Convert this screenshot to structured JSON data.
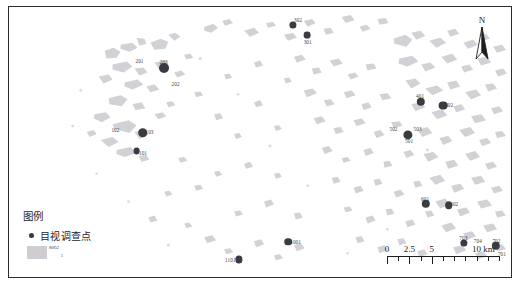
{
  "map": {
    "title": "visual-survey-point-distribution-map",
    "background_color": "#ffffff",
    "border_color": "#2b2b30",
    "patch_color": "#cdcdd2",
    "point_color": "#3a3a40"
  },
  "north_arrow": {
    "label": "N",
    "icon": "north-arrow-icon"
  },
  "legend": {
    "title": "图例",
    "point_entry": {
      "icon": "filled-circle-icon",
      "label": "目视调查点"
    },
    "area_entry": {
      "swatch_color": "#cdcdd2",
      "label": "86852",
      "sub_label": "1"
    }
  },
  "scale_bar": {
    "ticks": [
      {
        "label": "0",
        "position_pct": 0
      },
      {
        "label": "2.5",
        "position_pct": 20
      },
      {
        "label": "5",
        "position_pct": 40
      },
      {
        "label": "10 km",
        "position_pct": 86
      }
    ],
    "minor_ticks_pct": [
      10,
      30,
      50,
      60,
      70,
      80,
      90,
      100
    ],
    "major_ticks_pct": [
      0,
      20,
      40
    ]
  },
  "survey_points": [
    {
      "id": "302",
      "x_pct": 56.5,
      "y_pct": 6.5,
      "r": 3.6,
      "label_dx": 5.5,
      "label_dy": -4.5
    },
    {
      "id": "301",
      "x_pct": 59.4,
      "y_pct": 10.5,
      "r": 3.4,
      "label_dx": 0.5,
      "label_dy": 6.5
    },
    {
      "id": "201",
      "x_pct": 26.0,
      "y_pct": 20.0,
      "r": 0,
      "label_dx": 0,
      "label_dy": 0
    },
    {
      "id": "203",
      "x_pct": 30.8,
      "y_pct": 22.5,
      "r": 5.0,
      "label_dx": 0,
      "label_dy": -5.5
    },
    {
      "id": "202",
      "x_pct": 33.2,
      "y_pct": 28.5,
      "r": 0,
      "label_dx": 0,
      "label_dy": 0
    },
    {
      "id": "102",
      "x_pct": 21.2,
      "y_pct": 45.5,
      "r": 0,
      "label_dx": 0,
      "label_dy": 0
    },
    {
      "id": "103",
      "x_pct": 26.6,
      "y_pct": 46.5,
      "r": 4.8,
      "label_dx": 7.0,
      "label_dy": -0.5
    },
    {
      "id": "101",
      "x_pct": 25.4,
      "y_pct": 53.5,
      "r": 3.4,
      "label_dx": 6.5,
      "label_dy": 2.0
    },
    {
      "id": "401",
      "x_pct": 82.0,
      "y_pct": 35.0,
      "r": 4.2,
      "label_dx": -0.5,
      "label_dy": -5.5
    },
    {
      "id": "402",
      "x_pct": 86.4,
      "y_pct": 36.5,
      "r": 4.4,
      "label_dx": 6.5,
      "label_dy": -1.0
    },
    {
      "id": "502",
      "x_pct": 76.6,
      "y_pct": 45.0,
      "r": 0,
      "label_dx": 0,
      "label_dy": 0
    },
    {
      "id": "503",
      "x_pct": 81.4,
      "y_pct": 45.0,
      "r": 0,
      "label_dx": 0,
      "label_dy": 0
    },
    {
      "id": "501",
      "x_pct": 79.4,
      "y_pct": 47.5,
      "r": 4.6,
      "label_dx": 1.5,
      "label_dy": 6.0
    },
    {
      "id": "601",
      "x_pct": 83.0,
      "y_pct": 73.0,
      "r": 4.2,
      "label_dx": -0.5,
      "label_dy": -5.5
    },
    {
      "id": "602",
      "x_pct": 87.6,
      "y_pct": 73.5,
      "r": 3.8,
      "label_dx": 5.5,
      "label_dy": -1.0
    },
    {
      "id": "703",
      "x_pct": 90.6,
      "y_pct": 87.5,
      "r": 3.6,
      "label_dx": -0.5,
      "label_dy": -5.0
    },
    {
      "id": "704",
      "x_pct": 93.4,
      "y_pct": 86.5,
      "r": 0,
      "label_dx": 0,
      "label_dy": 0
    },
    {
      "id": "702",
      "x_pct": 97.0,
      "y_pct": 88.5,
      "r": 4.2,
      "label_dx": 0.5,
      "label_dy": -5.0
    },
    {
      "id": "701",
      "x_pct": 98.2,
      "y_pct": 91.5,
      "r": 0,
      "label_dx": 0,
      "label_dy": 0
    },
    {
      "id": "1001",
      "x_pct": 55.6,
      "y_pct": 87.0,
      "r": 3.8,
      "label_dx": 7.5,
      "label_dy": 0.5
    },
    {
      "id": "1101",
      "x_pct": 45.8,
      "y_pct": 93.5,
      "r": 3.6,
      "label_dx": -8.5,
      "label_dy": 0.5
    }
  ]
}
